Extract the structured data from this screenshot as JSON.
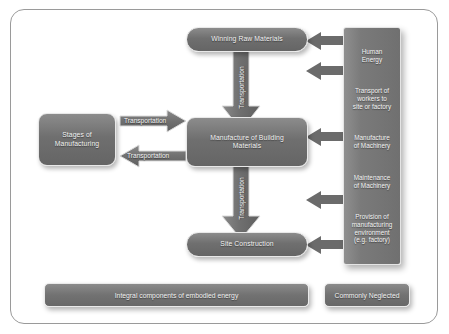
{
  "diagram": {
    "colors": {
      "node_fill_light": "#8c8c8c",
      "node_fill_dark": "#656565",
      "node_border": "#e8e8e8",
      "arrow_fill": "#6e6e6e",
      "frame_border": "#9a9a9a",
      "background": "#ffffff",
      "text": "#f2f2f2"
    },
    "nodes": [
      {
        "id": "winning-raw-materials",
        "label": "Winning Raw Materials"
      },
      {
        "id": "manufacture-of-building-materials",
        "label": "Manufacture of Building Materials"
      },
      {
        "id": "stages-of-manufacturing",
        "label": "Stages of Manufacturing"
      },
      {
        "id": "site-construction",
        "label": "Site Construction"
      }
    ],
    "arrow_labels": {
      "transport_down_top": "Transportation",
      "transport_down_bottom": "Transportation",
      "transport_right": "Transportation",
      "transport_left": "Transportation"
    },
    "inputs_column": {
      "id": "commonly-neglected-inputs",
      "items": [
        "Human\nEnergy",
        "Transport of\nworkers to\nsite or factory",
        "Manufacture\nof Machinery",
        "Maintenance\nof Machinery",
        "Provision of\nmanufacturing\nenvironment\n(e.g. factory)"
      ]
    },
    "legend": {
      "integral": "Integral components of embodied energy",
      "neglected": "Commonly Neglected"
    }
  }
}
